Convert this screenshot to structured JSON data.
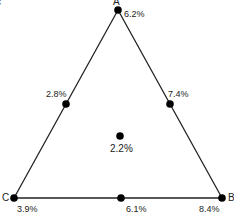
{
  "figure_letter": "c",
  "vertices": {
    "A": {
      "label": "A",
      "value": "6.2%"
    },
    "B": {
      "label": "B",
      "value": "8.4%"
    },
    "C": {
      "label": "C",
      "value": "3.9%"
    }
  },
  "midpoints": {
    "AC": {
      "value": "2.8%"
    },
    "AB": {
      "value": "7.4%"
    },
    "CB": {
      "value": "6.1%"
    }
  },
  "center": {
    "value": "2.2%"
  },
  "colors": {
    "line": "#222222",
    "dot": "#000000"
  }
}
